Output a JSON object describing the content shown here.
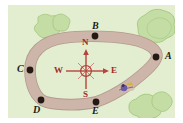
{
  "figure": {
    "kind": "trail-map",
    "background_color": "#e3eed1",
    "path_color": "#cdb5aa",
    "path_outline_color": "#b39a8e",
    "tree_color": "#bcd99a",
    "tree_outline_color": "#9cc075",
    "point_color": "#241a14",
    "label_color": "#1a1a1a",
    "compass_color": "#9e2b25",
    "walker_color": "#6a5aa8"
  },
  "points": [
    {
      "id": "A",
      "label": "A",
      "x": 148,
      "y": 52,
      "label_x": 157,
      "label_y": 46
    },
    {
      "id": "B",
      "label": "B",
      "x": 87,
      "y": 31,
      "label_x": 84,
      "label_y": 16
    },
    {
      "id": "C",
      "label": "C",
      "x": 22,
      "y": 65,
      "label_x": 9,
      "label_y": 59
    },
    {
      "id": "D",
      "label": "D",
      "x": 33,
      "y": 95,
      "label_x": 27,
      "label_y": 100
    },
    {
      "id": "E",
      "label": "E",
      "x": 88,
      "y": 97,
      "label_x": 84,
      "label_y": 102
    }
  ],
  "compass": {
    "center_x": 78,
    "center_y": 66,
    "north": "N",
    "south": "S",
    "east": "E",
    "west": "W",
    "north_pos": {
      "x": 74,
      "y": 40
    },
    "south_pos": {
      "x": 75,
      "y": 85
    },
    "east_pos": {
      "x": 104,
      "y": 62
    },
    "west_pos": {
      "x": 48,
      "y": 62
    }
  },
  "trees": [
    {
      "id": "tree-top-left",
      "cx": 38,
      "cy": 21,
      "r": 11
    },
    {
      "id": "tree-top-left-2",
      "cx": 53,
      "cy": 18,
      "r": 8
    },
    {
      "id": "tree-top-right",
      "cx": 150,
      "cy": 18,
      "r": 14
    },
    {
      "id": "tree-bottom-right",
      "cx": 140,
      "cy": 101,
      "r": 12
    },
    {
      "id": "tree-bottom-right-2",
      "cx": 155,
      "cy": 96,
      "r": 9
    }
  ],
  "walker": {
    "id": "walker-on-path",
    "x": 118,
    "y": 84,
    "label": "walker"
  }
}
